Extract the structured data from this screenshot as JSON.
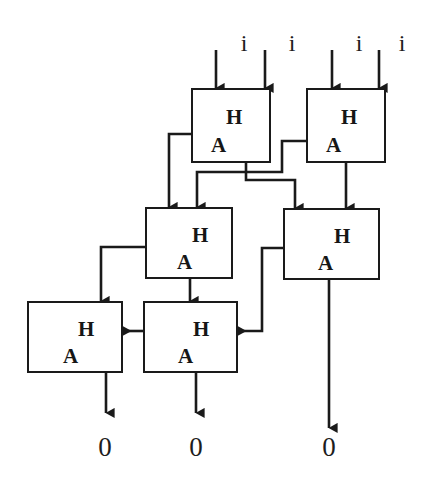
{
  "diagram": {
    "line_color": "#1a1a1a",
    "text_color": "#161616",
    "background": "#ffffff",
    "cell_label_top": "H",
    "cell_label_bottom": "A",
    "cells": [
      {
        "id": "ha-top-left",
        "label_top": "H",
        "label_bottom": "A",
        "x": 191,
        "y": 88,
        "w": 80,
        "h": 75
      },
      {
        "id": "ha-top-right",
        "label_top": "H",
        "label_bottom": "A",
        "x": 306,
        "y": 88,
        "w": 80,
        "h": 75
      },
      {
        "id": "ha-middle-left",
        "label_top": "H",
        "label_bottom": "A",
        "x": 145,
        "y": 207,
        "w": 88,
        "h": 72
      },
      {
        "id": "ha-middle-right",
        "label_top": "H",
        "label_bottom": "A",
        "x": 283,
        "y": 208,
        "w": 97,
        "h": 72
      },
      {
        "id": "ha-bottom-left",
        "label_top": "H",
        "label_bottom": "A",
        "x": 27,
        "y": 301,
        "w": 96,
        "h": 72
      },
      {
        "id": "ha-bottom-middle",
        "label_top": "H",
        "label_bottom": "A",
        "x": 143,
        "y": 301,
        "w": 95,
        "h": 72
      }
    ],
    "inputs": [
      {
        "id": "input-1",
        "label": "i",
        "x": 243,
        "y": 31
      },
      {
        "id": "input-2",
        "label": "i",
        "x": 291,
        "y": 31
      },
      {
        "id": "input-3",
        "label": "i",
        "x": 359,
        "y": 31
      },
      {
        "id": "input-4",
        "label": "i",
        "x": 402,
        "y": 31
      }
    ],
    "outputs": [
      {
        "id": "output-1",
        "label": "0",
        "x": 105,
        "y": 434
      },
      {
        "id": "output-2",
        "label": "0",
        "x": 196,
        "y": 434
      },
      {
        "id": "output-3",
        "label": "0",
        "x": 329,
        "y": 434
      }
    ]
  }
}
